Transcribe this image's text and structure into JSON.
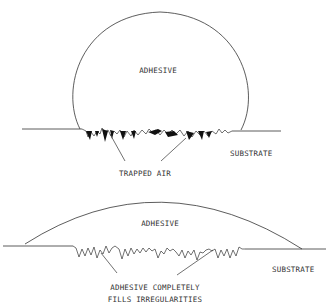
{
  "figure_top": {
    "adhesive_label": "ADHESIVE",
    "substrate_label": "SUBSTRATE",
    "callout_label": "TRAPPED AIR"
  },
  "figure_bottom": {
    "adhesive_label": "ADHESIVE",
    "substrate_label": "SUBSTRATE",
    "callout_line1": "ADHESIVE COMPLETELY",
    "callout_line2": "FILLS IRREGULARITIES"
  },
  "colors": {
    "line": "#333333",
    "fill_air": "#111111",
    "background": "#ffffff"
  }
}
